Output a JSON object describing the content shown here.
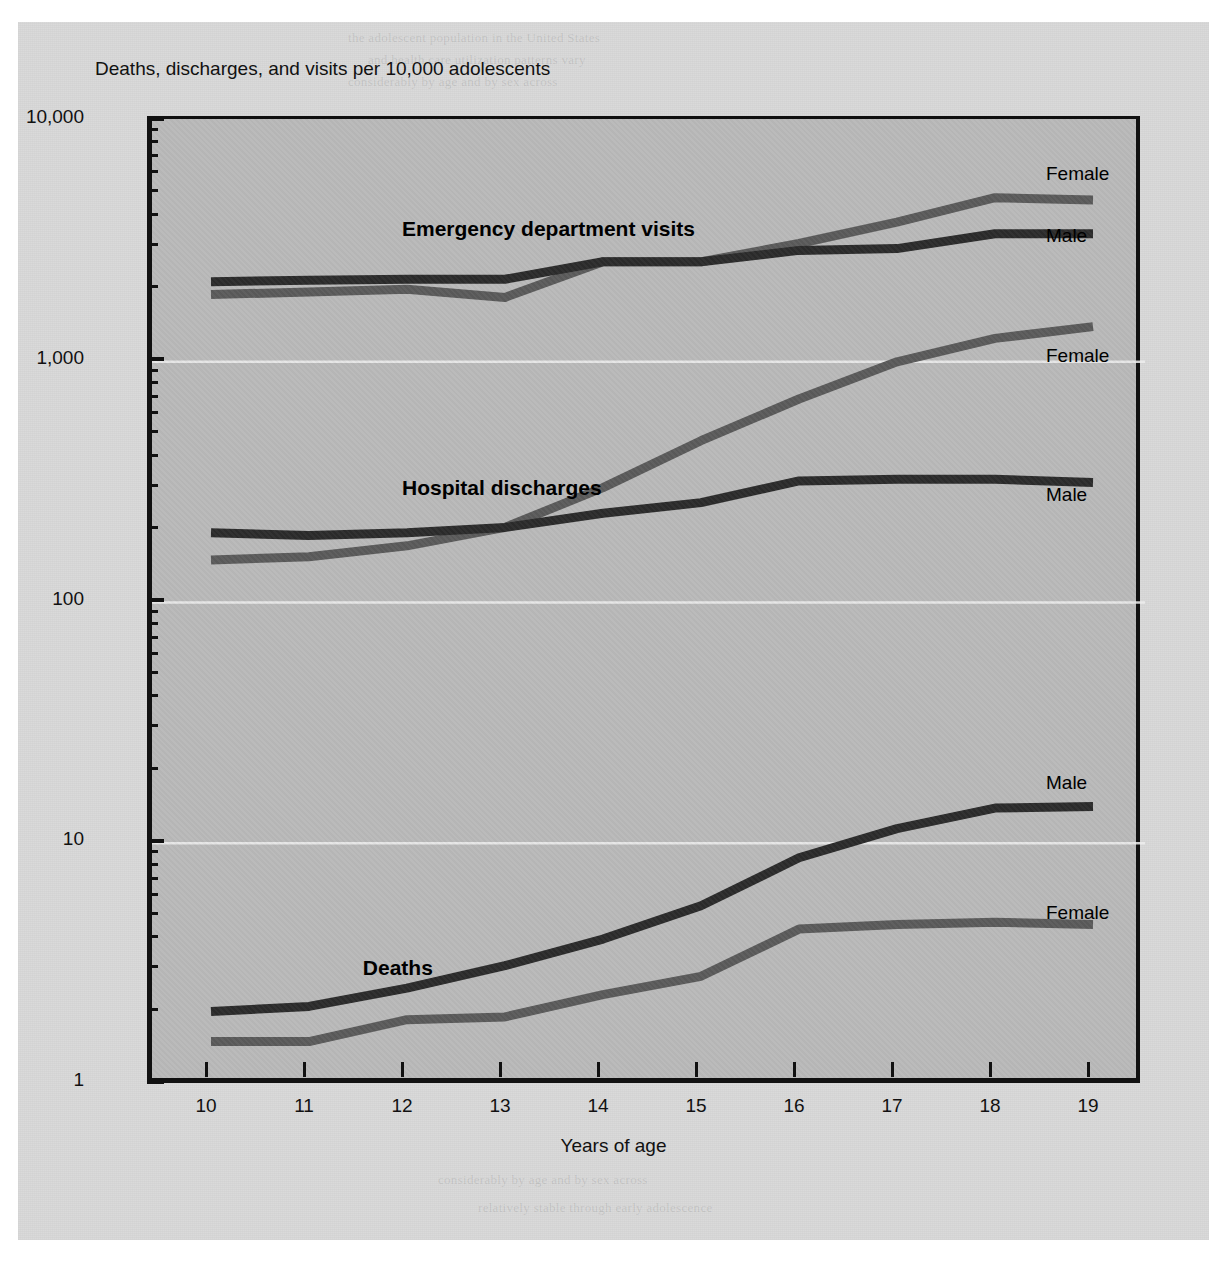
{
  "chart_data": {
    "type": "line",
    "title": "Deaths, discharges, and visits per 10,000 adolescents",
    "xlabel": "Years of age",
    "ylabel": "",
    "yscale": "log",
    "ylim": [
      1,
      10000
    ],
    "grid": true,
    "legend_position": "inline-right",
    "x": [
      10,
      11,
      12,
      13,
      14,
      15,
      16,
      17,
      18,
      19
    ],
    "categories": [
      "10",
      "11",
      "12",
      "13",
      "14",
      "15",
      "16",
      "17",
      "18",
      "19"
    ],
    "ytick_labels": [
      "10,000",
      "1,000",
      "100",
      "10",
      "1"
    ],
    "ytick_values": [
      10000,
      1000,
      100,
      10,
      1
    ],
    "groups": [
      {
        "name": "Emergency department visits",
        "series": [
          {
            "name": "Female",
            "color": "#5a5a5a",
            "values": [
              1900,
              1950,
              2000,
              1850,
              2600,
              2600,
              3100,
              3800,
              4800,
              4700
            ]
          },
          {
            "name": "Male",
            "color": "#2b2b2b",
            "values": [
              2150,
              2180,
              2200,
              2200,
              2600,
              2600,
              2900,
              2950,
              3400,
              3400
            ]
          }
        ]
      },
      {
        "name": "Hospital discharges",
        "series": [
          {
            "name": "Female",
            "color": "#5a5a5a",
            "values": [
              150,
              155,
              172,
              205,
              300,
              470,
              700,
              1000,
              1250,
              1400
            ]
          },
          {
            "name": "Male",
            "color": "#2b2b2b",
            "values": [
              195,
              190,
              195,
              205,
              235,
              260,
              320,
              325,
              325,
              315
            ]
          }
        ]
      },
      {
        "name": "Deaths",
        "series": [
          {
            "name": "Male",
            "color": "#2b2b2b",
            "values": [
              2.0,
              2.1,
              2.5,
              3.1,
              4.0,
              5.5,
              8.7,
              11.5,
              14.0,
              14.2
            ]
          },
          {
            "name": "Female",
            "color": "#5a5a5a",
            "values": [
              1.5,
              1.5,
              1.85,
              1.9,
              2.35,
              2.8,
              4.4,
              4.6,
              4.7,
              4.6
            ]
          }
        ]
      }
    ],
    "annotations": [
      {
        "text": "Emergency department visits",
        "x": 12.0,
        "y": 3400
      },
      {
        "text": "Hospital discharges",
        "x": 12.0,
        "y": 285
      },
      {
        "text": "Deaths",
        "x": 11.6,
        "y": 2.9
      }
    ]
  },
  "axis": {
    "y_title": "Deaths, discharges, and visits per 10,000 adolescents",
    "x_title": "Years of age"
  },
  "colors": {
    "male_line": "#2b2b2b",
    "female_line": "#5a5a5a",
    "plot_background": "#b9b9b9",
    "page_background": "#d9d9d9",
    "axis": "#111111",
    "gridline": "#efefef"
  },
  "series_end_labels": [
    {
      "group": "Emergency department visits",
      "name": "Female",
      "top": 163,
      "left": 1046
    },
    {
      "group": "Emergency department visits",
      "name": "Male",
      "top": 225,
      "left": 1046
    },
    {
      "group": "Hospital discharges",
      "name": "Female",
      "top": 345,
      "left": 1046
    },
    {
      "group": "Hospital discharges",
      "name": "Male",
      "top": 484,
      "left": 1046
    },
    {
      "group": "Deaths",
      "name": "Male",
      "top": 772,
      "left": 1046
    },
    {
      "group": "Deaths",
      "name": "Female",
      "top": 902,
      "left": 1046
    }
  ],
  "ghost_text": [
    "the adolescent population in the United States",
    "and health care utilization patterns vary",
    "considerably by age and by sex across",
    "these three measures of health status.",
    "Emergency department visit rates remain",
    "relatively stable through early adolescence",
    "before rising sharply in the later teen years.",
    "Hospital discharge rates for females increase",
    "markedly after age 13, driven largely by",
    "pregnancy-related hospitalizations, while",
    "male discharge rates remain comparatively",
    "flat throughout the adolescent years.",
    "Death rates for males rise steeply from",
    "age 13 onward, reaching nearly three times",
    "the female rate by age 19, reflecting the",
    "greater incidence of unintentional injury,",
    "homicide, and suicide among adolescent males."
  ]
}
